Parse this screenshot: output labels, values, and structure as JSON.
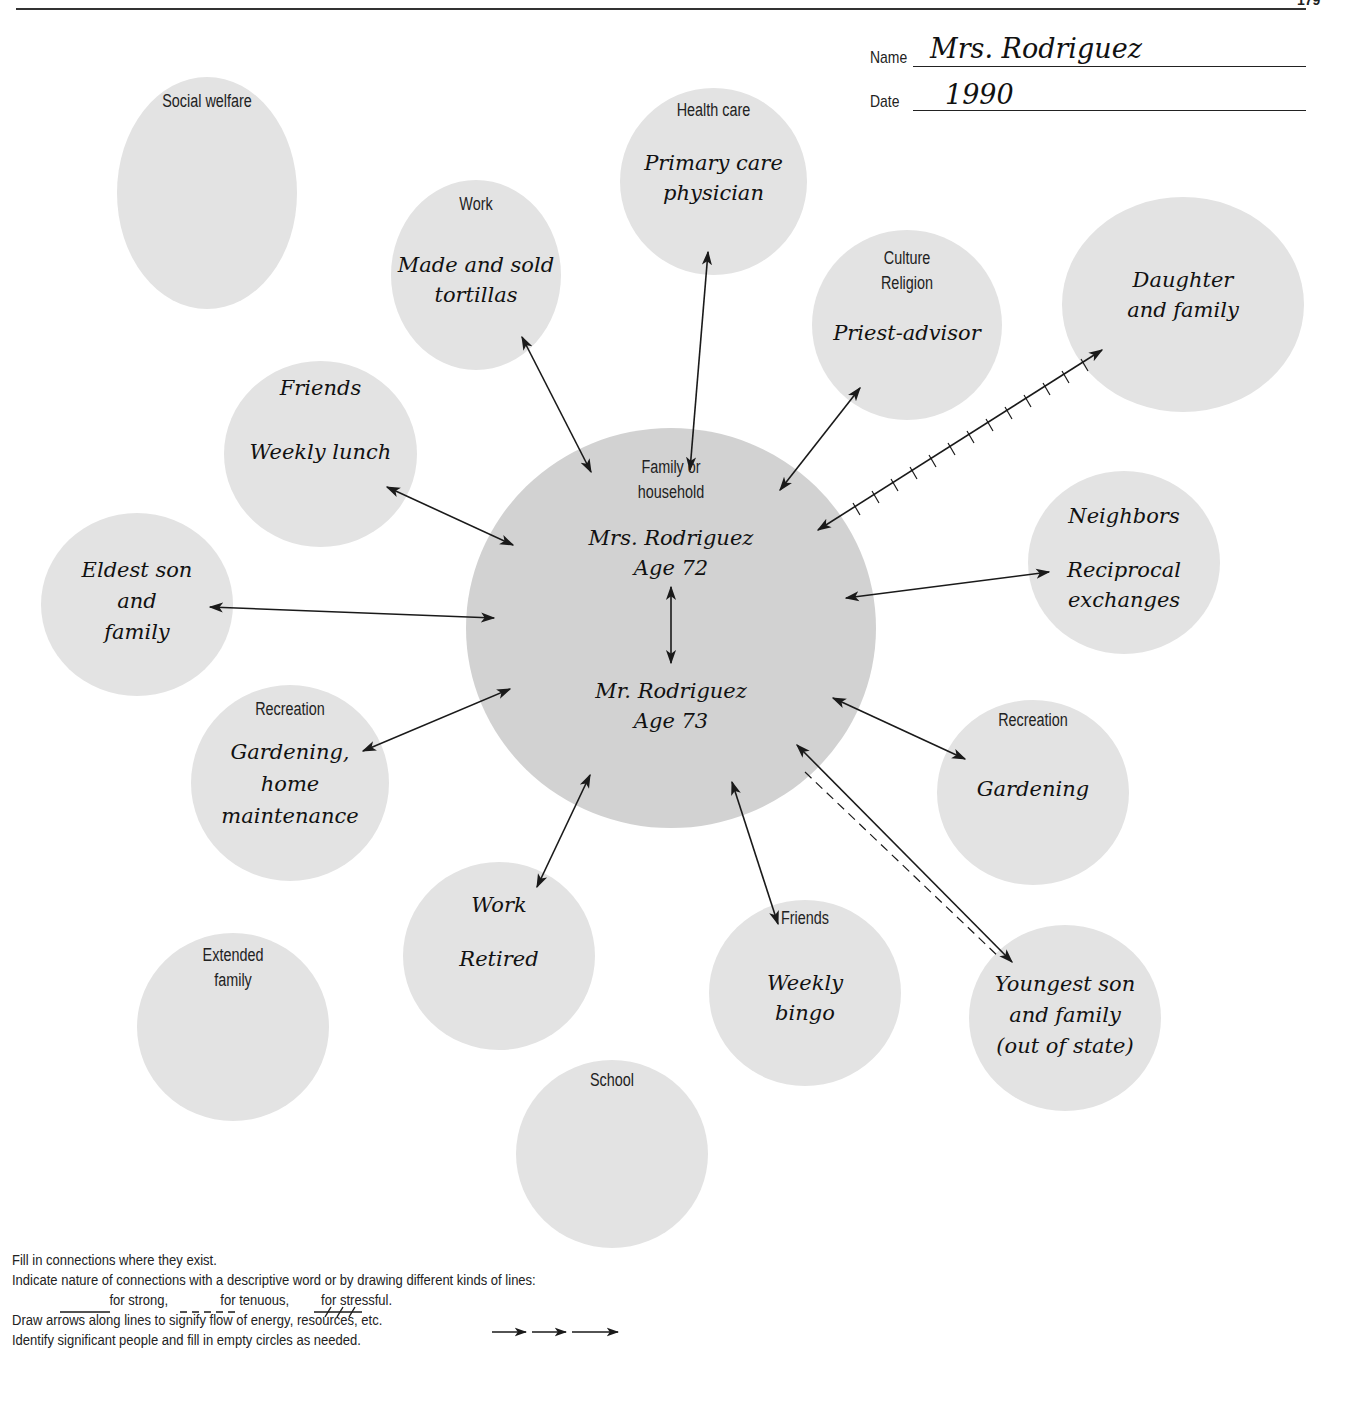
{
  "page": {
    "number": "179"
  },
  "header": {
    "name_label": "Name",
    "name_value": "Mrs. Rodriguez",
    "date_label": "Date",
    "date_value": "1990"
  },
  "colors": {
    "center_fill": "#d2d2d2",
    "node_fill": "#e3e3e3",
    "line": "#1a1a1a"
  },
  "center": {
    "category": "Family or household",
    "category_lines": [
      "Family or",
      "household"
    ],
    "person1_name": "Mrs. Rodriguez",
    "person1_age": "Age 72",
    "person2_name": "Mr. Rodriguez",
    "person2_age": "Age 73"
  },
  "nodes": [
    {
      "id": "social-welfare",
      "category": "Social welfare",
      "entry": [],
      "connection": "none"
    },
    {
      "id": "work-1",
      "category": "Work",
      "entry": [
        "Made and sold",
        "tortillas"
      ],
      "connection": "strong"
    },
    {
      "id": "health-care",
      "category": "Health care",
      "entry": [
        "Primary care",
        "physician"
      ],
      "connection": "strong"
    },
    {
      "id": "culture-religion",
      "category": "Culture Religion",
      "category_lines": [
        "Culture",
        "Religion"
      ],
      "entry": [
        "Priest-advisor"
      ],
      "connection": "strong"
    },
    {
      "id": "daughter",
      "category": "",
      "entry": [
        "Daughter",
        "and family"
      ],
      "connection": "stressful"
    },
    {
      "id": "friends-lunch",
      "category": "",
      "entry": [
        "Friends",
        "Weekly lunch"
      ],
      "connection": "strong"
    },
    {
      "id": "neighbors",
      "category": "",
      "entry": [
        "Neighbors",
        "Reciprocal",
        "exchanges"
      ],
      "connection": "strong"
    },
    {
      "id": "eldest-son",
      "category": "",
      "entry": [
        "Eldest son",
        "and",
        "family"
      ],
      "connection": "strong"
    },
    {
      "id": "recreation-1",
      "category": "Recreation",
      "entry": [
        "Gardening,",
        "home",
        "maintenance"
      ],
      "connection": "strong"
    },
    {
      "id": "recreation-2",
      "category": "Recreation",
      "entry": [
        "Gardening"
      ],
      "connection": "strong"
    },
    {
      "id": "work-2",
      "category": "",
      "entry": [
        "Work",
        "Retired"
      ],
      "connection": "strong"
    },
    {
      "id": "friends-bingo",
      "category": "Friends",
      "entry": [
        "Weekly",
        "bingo"
      ],
      "connection": "strong"
    },
    {
      "id": "youngest-son",
      "category": "",
      "entry": [
        "Youngest son",
        "and family",
        "(out of state)"
      ],
      "connection": "strong and tenuous"
    },
    {
      "id": "extended-family",
      "category": "Extended family",
      "category_lines": [
        "Extended",
        "family"
      ],
      "entry": [],
      "connection": "none"
    },
    {
      "id": "school",
      "category": "School",
      "entry": [],
      "connection": "none"
    }
  ],
  "instructions": [
    "Fill in connections where they exist.",
    "Indicate nature of connections with a descriptive word or by drawing different kinds of lines:",
    "for strong,",
    "for tenuous,",
    "for stressful.",
    "Draw arrows along lines to signify flow of energy, resources, etc.",
    "Identify significant people and fill in empty circles as needed."
  ]
}
